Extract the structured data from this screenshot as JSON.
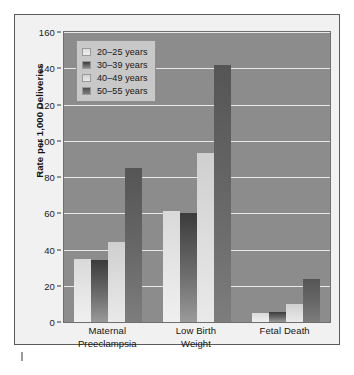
{
  "chart_data": {
    "type": "bar",
    "title": "",
    "xlabel": "",
    "ylabel": "Rate per 1,000 Deliveries",
    "ylim": [
      0,
      160
    ],
    "yticks": [
      0,
      20,
      40,
      60,
      80,
      100,
      120,
      140,
      160
    ],
    "ytick_labels": [
      "0",
      "20",
      "40",
      "60",
      "80",
      "100",
      "120",
      "140",
      "160"
    ],
    "grid": "horizontal",
    "legend_position": "top-left",
    "categories": [
      "Maternal Preeclampsia",
      "Low Birth Weight",
      "Fetal Death"
    ],
    "category_lines": [
      [
        "Maternal",
        "Preeclampsia"
      ],
      [
        "Low Birth",
        "Weight"
      ],
      [
        "Fetal Death"
      ]
    ],
    "series": [
      {
        "name": "20–25 years",
        "values": [
          35,
          61.5,
          5
        ]
      },
      {
        "name": "30–39 years",
        "values": [
          34,
          60,
          5.5
        ]
      },
      {
        "name": "40–49 years",
        "values": [
          44,
          93,
          10
        ]
      },
      {
        "name": "50–55 years",
        "values": [
          85,
          142,
          24
        ]
      }
    ]
  },
  "legend": {
    "items": [
      {
        "label": "20–25 years"
      },
      {
        "label": "30–39 years"
      },
      {
        "label": "40–49 years"
      },
      {
        "label": "50–55 years"
      }
    ]
  },
  "colors": {
    "panel_background": "#f1f1f1",
    "plot_background": "#8c8c8c",
    "gridline": "#e8e8e8",
    "legend_background": "#c8c8c8",
    "border": "#5a5a5a",
    "series_20_25": "#e6e6e6",
    "series_30_39": "#4a4a4a",
    "series_40_49": "#dedede",
    "series_50_55": "#6a6a6a"
  }
}
